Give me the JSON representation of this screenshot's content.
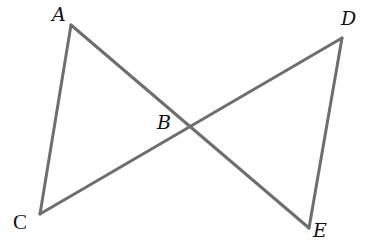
{
  "diagram": {
    "type": "geometry",
    "line_color": "#6e6e6e",
    "label_color": "#111111",
    "points": {
      "A": {
        "label": "A",
        "x": 71,
        "y": 25,
        "label_x": 52,
        "label_y": 5
      },
      "B": {
        "label": "B",
        "x": 189,
        "y": 125,
        "label_x": 157,
        "label_y": 113
      },
      "C": {
        "label": "C",
        "x": 40,
        "y": 214,
        "label_x": 13,
        "label_y": 213
      },
      "D": {
        "label": "D",
        "x": 342,
        "y": 38,
        "label_x": 341,
        "label_y": 9
      },
      "E": {
        "label": "E",
        "x": 309,
        "y": 228,
        "label_x": 313,
        "label_y": 221
      }
    },
    "segments": [
      {
        "from": "A",
        "to": "C"
      },
      {
        "from": "A",
        "to": "E"
      },
      {
        "from": "C",
        "to": "D"
      },
      {
        "from": "D",
        "to": "E"
      }
    ]
  }
}
